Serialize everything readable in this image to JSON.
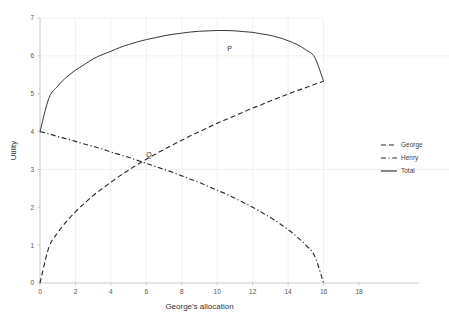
{
  "chart_data": {
    "type": "line",
    "title": "",
    "xlabel": "George's allocation",
    "ylabel": "Utility",
    "xlim": [
      0,
      18
    ],
    "ylim": [
      0,
      7
    ],
    "xticks": [
      0,
      2,
      4,
      6,
      8,
      10,
      12,
      14,
      16,
      18
    ],
    "xtick_labels": [
      "0",
      "2",
      "4",
      "6",
      "8",
      "10",
      "12",
      "14",
      "16",
      "18"
    ],
    "yticks": [
      0,
      1,
      2,
      3,
      4,
      5,
      6,
      7
    ],
    "ytick_labels": [
      "0",
      "1",
      "2",
      "3",
      "4",
      "5",
      "6",
      "7"
    ],
    "grid": true,
    "grid_x_values": [
      0,
      2,
      4,
      6,
      8,
      10,
      12,
      14,
      16
    ],
    "grid_y_values": [
      3,
      6,
      7
    ],
    "legend_position": "right",
    "x": [
      0,
      0.5,
      1,
      1.5,
      2,
      2.5,
      3,
      3.5,
      4,
      4.5,
      5,
      5.5,
      6,
      6.5,
      7,
      7.5,
      8,
      8.5,
      9,
      9.5,
      10,
      10.5,
      11,
      11.5,
      12,
      12.5,
      13,
      13.5,
      14,
      14.5,
      15,
      15.5,
      16
    ],
    "series": [
      {
        "name": "George",
        "style": "dashed",
        "color": "#2b2b2b",
        "values": [
          0,
          0.94,
          1.33,
          1.63,
          1.88,
          2.1,
          2.31,
          2.49,
          2.66,
          2.83,
          2.98,
          3.13,
          3.27,
          3.4,
          3.53,
          3.65,
          3.77,
          3.89,
          4.0,
          4.11,
          4.22,
          4.32,
          4.42,
          4.52,
          4.62,
          4.71,
          4.81,
          4.9,
          4.99,
          5.08,
          5.16,
          5.25,
          5.33
        ]
      },
      {
        "name": "Henry",
        "style": "dashdot",
        "color": "#2b2b2b",
        "values": [
          4.0,
          3.94,
          3.87,
          3.81,
          3.74,
          3.67,
          3.61,
          3.54,
          3.46,
          3.39,
          3.32,
          3.24,
          3.16,
          3.08,
          3.0,
          2.92,
          2.83,
          2.74,
          2.65,
          2.55,
          2.45,
          2.35,
          2.24,
          2.12,
          2.0,
          1.87,
          1.73,
          1.58,
          1.41,
          1.22,
          1.0,
          0.71,
          0.0
        ]
      },
      {
        "name": "Total",
        "style": "solid",
        "color": "#2b2b2b",
        "values": [
          4.0,
          4.88,
          5.2,
          5.44,
          5.62,
          5.77,
          5.92,
          6.03,
          6.12,
          6.22,
          6.3,
          6.37,
          6.43,
          6.48,
          6.53,
          6.57,
          6.6,
          6.63,
          6.65,
          6.66,
          6.67,
          6.67,
          6.66,
          6.64,
          6.62,
          6.58,
          6.54,
          6.48,
          6.4,
          6.3,
          6.16,
          5.96,
          5.33
        ]
      }
    ],
    "annotations": [
      {
        "text": "P",
        "x": 10.7,
        "y": 6.12
      },
      {
        "text": "Q",
        "x": 6.15,
        "y": 3.32
      }
    ]
  },
  "legend": {
    "entries": [
      {
        "label": "George",
        "style": "dashed"
      },
      {
        "label": "Henry",
        "style": "dashdot"
      },
      {
        "label": "Total",
        "style": "solid"
      }
    ]
  }
}
